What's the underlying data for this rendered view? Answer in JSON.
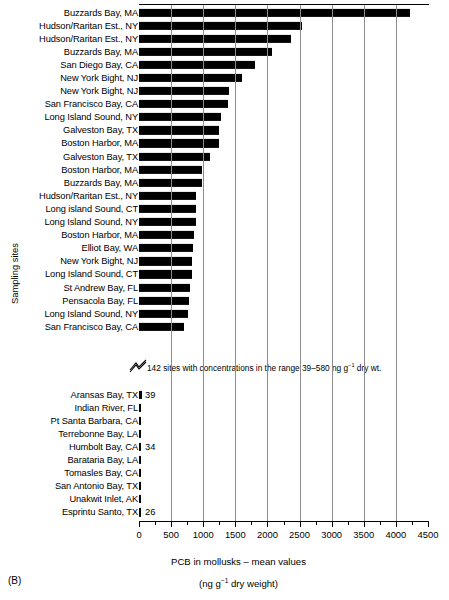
{
  "panel": {
    "letter": "(B)"
  },
  "chart_data": {
    "type": "bar",
    "orientation": "horizontal",
    "title": "",
    "xlabel": "PCB in mollusks – mean values",
    "xlabel_units": "(ng g⁻¹ dry weight)",
    "ylabel": "Sampling sites",
    "xlim": [
      0,
      4500
    ],
    "xticks": [
      0,
      500,
      1000,
      1500,
      2000,
      2500,
      3000,
      3500,
      4000,
      4500
    ],
    "xtick_labels": [
      "0",
      "500",
      "1000",
      "1500",
      "2000",
      "2500",
      "3000",
      "3500",
      "4000",
      "4500"
    ],
    "minor_ticks": true,
    "grid": "vertical",
    "grid_color": "#8d8d8d",
    "bar_color": "#000000",
    "axis_break_note": "142 sites with concentrations in the range 39–580 ng g⁻¹ dry wt.",
    "categories": [
      "Buzzards Bay, MA",
      "Hudson/Raritan Est., NY",
      "Hudson/Raritan Est., NY",
      "Buzzards Bay, MA",
      "San Diego Bay, CA",
      "New York Bight, NJ",
      "New York Bight, NJ",
      "San Francisco Bay, CA",
      "Long Island Sound, NY",
      "Galveston Bay, TX",
      "Boston Harbor, MA",
      "Galveston Bay, TX",
      "Boston Harbor, MA",
      "Buzzards Bay, MA",
      "Hudson/Raritan Est., NY",
      "Long island Sound, CT",
      "Long Island Sound, NY",
      "Boston Harbor, MA",
      "Elliot Bay, WA",
      "New York Bight, NJ",
      "Long Island Sound, CT",
      "St Andrew Bay, FL",
      "Pensacola Bay, FL",
      "Long Island Sound, NY",
      "San Francisco Bay, CA"
    ],
    "values": [
      4220,
      2540,
      2370,
      2070,
      1800,
      1600,
      1400,
      1390,
      1280,
      1250,
      1250,
      1100,
      980,
      980,
      890,
      890,
      890,
      860,
      840,
      830,
      830,
      790,
      780,
      760,
      700
    ],
    "lower_categories": [
      "Aransas Bay, TX",
      "Indian River, FL",
      "Pt Santa Barbara, CA",
      "Terrebonne Bay, LA",
      "Humbolt Bay, CA",
      "Barataria Bay, LA",
      "Tomasles Bay, CA",
      "San Antonio Bay, TX",
      "Unakwit Inlet, AK",
      "Esprintu Santo, TX"
    ],
    "lower_values": [
      39,
      38,
      37,
      36,
      34,
      32,
      30,
      29,
      28,
      26
    ],
    "lower_value_labels": [
      "39",
      "",
      "",
      "",
      "34",
      "",
      "",
      "",
      "",
      "26"
    ]
  }
}
